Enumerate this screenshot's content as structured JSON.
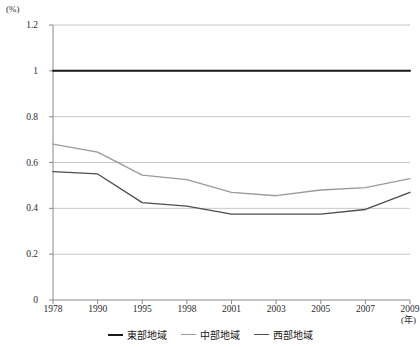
{
  "chart_data": {
    "type": "line",
    "title": "",
    "subtitle": "",
    "xlabel": "(年)",
    "ylabel": "(%)",
    "x": [
      "1978",
      "1990",
      "1995",
      "1998",
      "2001",
      "2003",
      "2005",
      "2007",
      "2009"
    ],
    "categories": [
      "1978",
      "1990",
      "1995",
      "1998",
      "2001",
      "2003",
      "2005",
      "2007",
      "2009"
    ],
    "ylim": [
      0,
      1.2
    ],
    "yticks": [
      "0",
      "0.2",
      "0.4",
      "0.6",
      "0.8",
      "1",
      "1.2"
    ],
    "ytick_values": [
      0,
      0.2,
      0.4,
      0.6,
      0.8,
      1.0,
      1.2
    ],
    "grid": true,
    "grid_axis": "y",
    "legend_position": "bottom-center",
    "series": [
      {
        "name": "東部地域",
        "color": "#1a1a1a",
        "width": 2.0,
        "values": [
          1.0,
          1.0,
          1.0,
          1.0,
          1.0,
          1.0,
          1.0,
          1.0,
          1.0
        ]
      },
      {
        "name": "中部地域",
        "color": "#9a9a9a",
        "width": 1.3,
        "values": [
          0.68,
          0.645,
          0.545,
          0.525,
          0.47,
          0.455,
          0.48,
          0.49,
          0.53
        ]
      },
      {
        "name": "西部地域",
        "color": "#4d4d4d",
        "width": 1.3,
        "values": [
          0.56,
          0.55,
          0.425,
          0.41,
          0.375,
          0.375,
          0.375,
          0.395,
          0.47
        ]
      }
    ]
  },
  "axes": {
    "unit_y": "(%)",
    "unit_x": "(年)"
  },
  "colors": {
    "axis": "#8a8a8a",
    "grid": "#b8b8b8",
    "text": "#2b2b2b",
    "series_east": "#1a1a1a",
    "series_central": "#9a9a9a",
    "series_west": "#4d4d4d"
  }
}
